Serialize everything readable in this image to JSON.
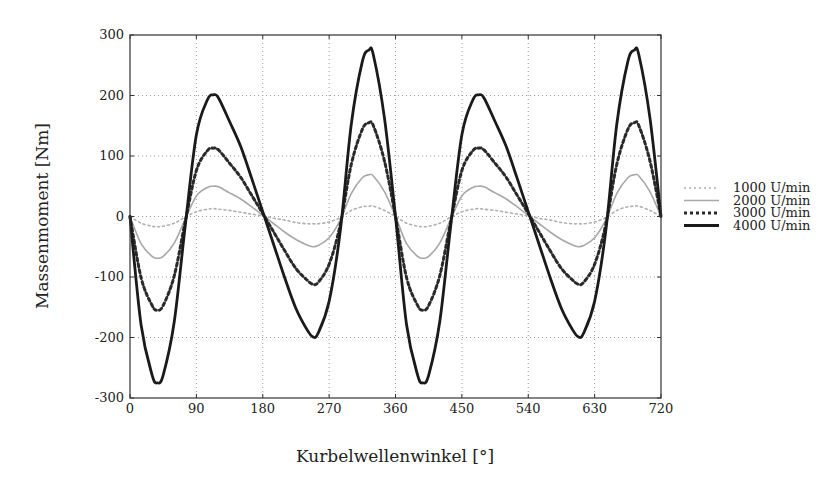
{
  "chart_data": {
    "type": "line",
    "title": "",
    "xlabel": "Kurbelwellenwinkel [°]",
    "ylabel": "Massenmoment [Nm]",
    "xlim": [
      0,
      720
    ],
    "ylim": [
      -300,
      300
    ],
    "xticks": [
      0,
      90,
      180,
      270,
      360,
      450,
      540,
      630,
      720
    ],
    "yticks": [
      300,
      200,
      100,
      0,
      -100,
      -200,
      -300
    ],
    "grid": true,
    "legend_position": "right",
    "x": [
      0,
      15,
      30,
      37,
      45,
      60,
      75,
      90,
      105,
      113,
      120,
      135,
      150,
      165,
      180,
      195,
      210,
      225,
      240,
      248,
      255,
      270,
      285,
      300,
      315,
      324,
      330,
      345,
      360,
      375,
      390,
      397,
      405,
      420,
      435,
      450,
      465,
      473,
      480,
      495,
      510,
      525,
      540,
      555,
      570,
      585,
      600,
      608,
      615,
      630,
      645,
      660,
      675,
      684,
      690,
      705,
      720
    ],
    "series": [
      {
        "name": "1000 U/min",
        "style": "dotted-light",
        "color": "#b0b0b0",
        "values": [
          0,
          -11,
          -16,
          -17,
          -16,
          -11,
          -1,
          8,
          12,
          13,
          12,
          10,
          7,
          4,
          1,
          -3,
          -6,
          -10,
          -12,
          -12,
          -12,
          -9,
          -2,
          10,
          16,
          17,
          17,
          10,
          0,
          -11,
          -16,
          -17,
          -16,
          -11,
          -1,
          8,
          12,
          13,
          12,
          10,
          7,
          4,
          1,
          -3,
          -6,
          -10,
          -12,
          -12,
          -12,
          -9,
          -2,
          10,
          16,
          17,
          17,
          10,
          0
        ]
      },
      {
        "name": "2000 U/min",
        "style": "solid-light",
        "color": "#a8a8a8",
        "values": [
          0,
          -45,
          -66,
          -69,
          -66,
          -44,
          -4,
          34,
          48,
          50,
          49,
          39,
          29,
          16,
          2,
          -12,
          -26,
          -38,
          -47,
          -50,
          -48,
          -35,
          -6,
          38,
          64,
          69,
          67,
          41,
          0,
          -45,
          -66,
          -69,
          -66,
          -44,
          -4,
          34,
          48,
          50,
          49,
          39,
          29,
          16,
          2,
          -12,
          -26,
          -38,
          -47,
          -50,
          -48,
          -35,
          -6,
          38,
          64,
          69,
          67,
          41,
          0
        ]
      },
      {
        "name": "3000 U/min",
        "style": "dotted-dark",
        "color": "#2a2a2a",
        "values": [
          0,
          -101,
          -147,
          -155,
          -147,
          -98,
          -8,
          76,
          109,
          113,
          110,
          88,
          65,
          35,
          5,
          -26,
          -57,
          -86,
          -105,
          -112,
          -109,
          -79,
          -14,
          86,
          144,
          155,
          150,
          92,
          0,
          -101,
          -147,
          -155,
          -147,
          -98,
          -8,
          76,
          109,
          113,
          110,
          88,
          65,
          35,
          5,
          -26,
          -57,
          -86,
          -105,
          -112,
          -109,
          -79,
          -14,
          86,
          144,
          155,
          150,
          92,
          0
        ]
      },
      {
        "name": "4000 U/min",
        "style": "solid-dark",
        "color": "#1a1a1a",
        "values": [
          0,
          -179,
          -262,
          -275,
          -262,
          -174,
          -14,
          135,
          193,
          201,
          196,
          157,
          116,
          63,
          8,
          -47,
          -102,
          -152,
          -187,
          -199,
          -193,
          -140,
          -25,
          152,
          256,
          275,
          267,
          163,
          0,
          -179,
          -262,
          -275,
          -262,
          -174,
          -14,
          135,
          193,
          201,
          196,
          157,
          116,
          63,
          8,
          -47,
          -102,
          -152,
          -187,
          -199,
          -193,
          -140,
          -25,
          152,
          256,
          275,
          267,
          163,
          0
        ]
      }
    ]
  },
  "labels": {
    "xlabel": "Kurbelwellenwinkel [°]",
    "ylabel": "Massenmoment [Nm]",
    "legend": [
      "1000 U/min",
      "2000 U/min",
      "3000 U/min",
      "4000 U/min"
    ]
  }
}
